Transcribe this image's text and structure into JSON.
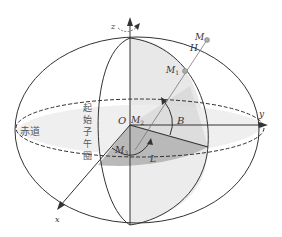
{
  "diagram": {
    "type": "geodetic-coordinate-system",
    "axes": {
      "x": "x",
      "y": "y",
      "z": "z"
    },
    "points": {
      "origin": "O",
      "M": "M",
      "M1": "M",
      "M1_sub": "1",
      "M2": "M",
      "M2_sub": "2",
      "M3": "M",
      "M3_sub": "3"
    },
    "quantities": {
      "height": "H",
      "latitude": "B",
      "longitude": "L"
    },
    "regions": {
      "equator": "赤道",
      "prime_meridian_chars": [
        "起",
        "始",
        "子",
        "午",
        "圈"
      ]
    },
    "colors": {
      "line": "#333333",
      "shade_light": "#e6e6e6",
      "shade_dark": "#b8b8b8",
      "point": "#999999"
    }
  }
}
